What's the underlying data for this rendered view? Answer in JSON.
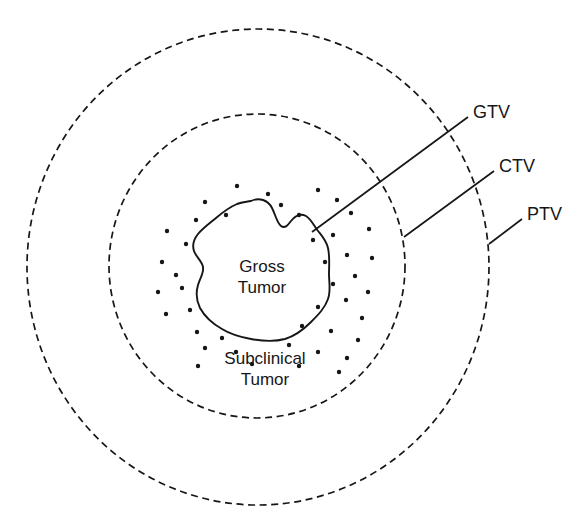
{
  "diagram": {
    "background_color": "#ffffff",
    "stroke_color": "#161616",
    "region_labels": {
      "gross_tumor_line1": "Gross",
      "gross_tumor_line2": "Tumor",
      "subclinical_line1": "Subclinical",
      "subclinical_line2": "Tumor"
    },
    "volume_labels": {
      "gtv": "GTV",
      "ctv": "CTV",
      "ptv": "PTV"
    }
  },
  "chart_data": {
    "type": "diagram",
    "legend_position": "right",
    "annotations": [
      {
        "name": "GTV",
        "label": "GTV",
        "meaning": "Gross Tumor Volume",
        "boundary": "solid-irregular-outline",
        "label_x": 473,
        "label_y": 112,
        "leader_from_x": 468,
        "leader_from_y": 117,
        "leader_to_x": 312,
        "leader_to_y": 232
      },
      {
        "name": "CTV",
        "label": "CTV",
        "meaning": "Clinical Target Volume",
        "boundary": "inner-dashed-circle",
        "label_x": 499,
        "label_y": 166,
        "leader_from_x": 494,
        "leader_from_y": 171,
        "leader_to_x": 404,
        "leader_to_y": 237
      },
      {
        "name": "PTV",
        "label": "PTV",
        "meaning": "Planning Target Volume",
        "boundary": "outer-dashed-circle",
        "label_x": 527,
        "label_y": 214,
        "leader_from_x": 522,
        "leader_from_y": 219,
        "leader_to_x": 489,
        "leader_to_y": 244
      }
    ],
    "shapes": [
      {
        "name": "outer-dashed-circle",
        "type": "ellipse",
        "cx": 258,
        "cy": 267,
        "rx": 231,
        "ry": 238,
        "style": "dashed"
      },
      {
        "name": "inner-dashed-circle",
        "type": "ellipse",
        "cx": 257,
        "cy": 266,
        "rx": 148,
        "ry": 152,
        "style": "dashed"
      },
      {
        "name": "gross-tumor-outline",
        "type": "closed-freeform",
        "cx": 253,
        "cy": 270,
        "approx_rx": 77,
        "approx_ry": 69,
        "style": "solid"
      }
    ],
    "subclinical_dots": {
      "count": 44,
      "radius": 2.2,
      "points": [
        [
          237,
          186
        ],
        [
          268,
          194
        ],
        [
          318,
          190
        ],
        [
          205,
          202
        ],
        [
          281,
          205
        ],
        [
          337,
          200
        ],
        [
          196,
          220
        ],
        [
          226,
          215
        ],
        [
          299,
          215
        ],
        [
          351,
          213
        ],
        [
          167,
          231
        ],
        [
          186,
          244
        ],
        [
          313,
          240
        ],
        [
          333,
          235
        ],
        [
          369,
          229
        ],
        [
          162,
          262
        ],
        [
          176,
          275
        ],
        [
          347,
          255
        ],
        [
          325,
          262
        ],
        [
          372,
          258
        ],
        [
          158,
          292
        ],
        [
          182,
          288
        ],
        [
          355,
          276
        ],
        [
          333,
          284
        ],
        [
          368,
          292
        ],
        [
          166,
          314
        ],
        [
          190,
          310
        ],
        [
          346,
          300
        ],
        [
          318,
          307
        ],
        [
          362,
          318
        ],
        [
          197,
          332
        ],
        [
          222,
          338
        ],
        [
          302,
          326
        ],
        [
          331,
          331
        ],
        [
          358,
          340
        ],
        [
          205,
          348
        ],
        [
          236,
          352
        ],
        [
          289,
          345
        ],
        [
          318,
          352
        ],
        [
          347,
          358
        ],
        [
          198,
          366
        ],
        [
          252,
          364
        ],
        [
          299,
          366
        ],
        [
          339,
          372
        ]
      ]
    }
  }
}
